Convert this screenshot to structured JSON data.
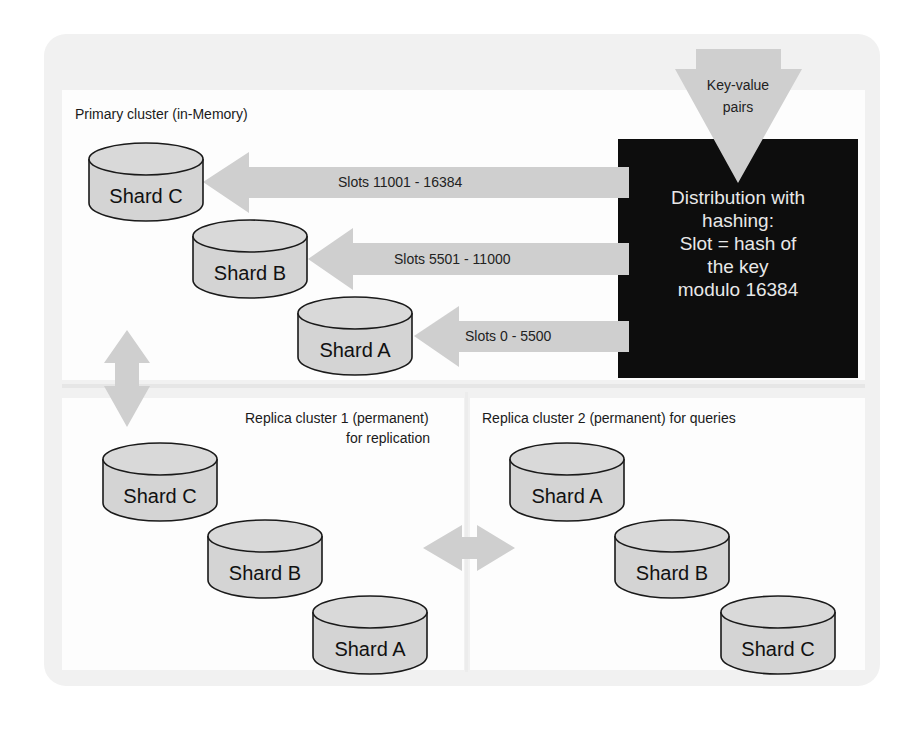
{
  "colors": {
    "arrow_fill": "#cfcfcf",
    "cylinder_fill": "#d4d4d4",
    "cylinder_stroke": "#1a1a1a",
    "hash_box_fill": "#0d0d0d",
    "hash_box_text": "#e8e8e8",
    "frame_bg": "#f1f1f1"
  },
  "input": {
    "label_line1": "Key-value",
    "label_line2": "pairs"
  },
  "hash_box": {
    "lines": [
      "Distribution with",
      "hashing:",
      "Slot = hash of",
      "the key",
      "modulo 16384"
    ]
  },
  "primary_cluster": {
    "title": "Primary cluster (in-Memory)",
    "shards": [
      {
        "label": "Shard C",
        "slot_range": "Slots 11001 - 16384"
      },
      {
        "label": "Shard B",
        "slot_range": "Slots 5501 - 11000"
      },
      {
        "label": "Shard A",
        "slot_range": "Slots 0 - 5500"
      }
    ]
  },
  "replica_cluster_1": {
    "title_line1": "Replica cluster 1 (permanent)",
    "title_line2": "for replication",
    "shards": [
      {
        "label": "Shard C"
      },
      {
        "label": "Shard B"
      },
      {
        "label": "Shard A"
      }
    ]
  },
  "replica_cluster_2": {
    "title": "Replica cluster 2 (permanent) for queries",
    "shards": [
      {
        "label": "Shard A"
      },
      {
        "label": "Shard B"
      },
      {
        "label": "Shard C"
      }
    ]
  },
  "connectors": {
    "primary_to_replica1": "bidirectional-vertical-arrow",
    "replica1_to_replica2": "bidirectional-horizontal-arrow"
  }
}
